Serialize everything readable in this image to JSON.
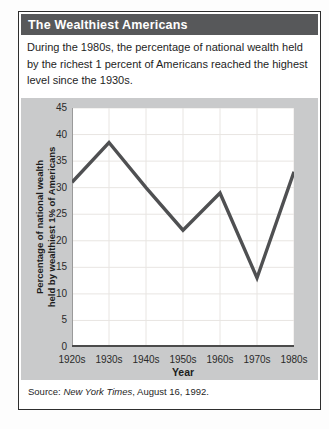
{
  "header": {
    "title": "The Wealthiest Americans"
  },
  "intro": "During the 1980s, the percentage of national wealth held by the richest 1 percent of Americans reached the highest level since the 1930s.",
  "source": {
    "prefix": "Source: ",
    "publication": "New York Times",
    "suffix": ", August 16, 1992."
  },
  "colors": {
    "header_bar": "#57585a",
    "panel_background": "#c9cacb",
    "plot_background": "#ffffff",
    "series_line": "#4f5052",
    "gridline": "#e8e5e2",
    "x_axis_line": "#4b4b4b",
    "y_axis_line": "#9a9a9a",
    "border": "#2e2e2e"
  },
  "chart_data": {
    "type": "line",
    "categories": [
      "1920s",
      "1930s",
      "1940s",
      "1950s",
      "1960s",
      "1970s",
      "1980s"
    ],
    "values": [
      31,
      38.5,
      30,
      22,
      29,
      13,
      33
    ],
    "title": "",
    "xlabel": "Year",
    "ylabel_line1": "Percentage of national wealth",
    "ylabel_line2": "held by wealthiest 1% of Americans",
    "ylim": [
      0,
      45
    ],
    "yticks": [
      0,
      5,
      10,
      15,
      20,
      25,
      30,
      35,
      40,
      45
    ],
    "grid": true,
    "legend": "none"
  }
}
